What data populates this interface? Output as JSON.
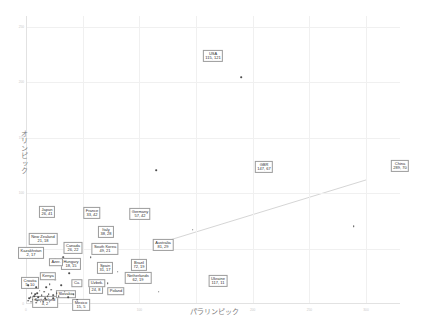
{
  "chart_data": {
    "type": "scatter",
    "title": "",
    "xlabel": "パラリンピック",
    "ylabel": "オリンピック",
    "xlim": [
      0,
      330
    ],
    "ylim": [
      0,
      260
    ],
    "grid": true,
    "legend": "none",
    "trendline": {
      "visible": true,
      "x1": 118,
      "y1": 55,
      "x2": 300,
      "y2": 112
    },
    "xticks": [
      "0",
      "50",
      "100",
      "150",
      "200",
      "250",
      "300"
    ],
    "yticks": [
      "0",
      "50",
      "100",
      "150",
      "200",
      "250"
    ],
    "points": [
      {
        "name": "USA",
        "x": 115,
        "y": 121,
        "label": "115, 121",
        "boxed": true,
        "lx": 213,
        "ly": 56
      },
      {
        "name": "China",
        "x": 289,
        "y": 70,
        "label": "289, 70",
        "boxed": true,
        "lx": 400,
        "ly": 166
      },
      {
        "name": "GBR",
        "x": 147,
        "y": 67,
        "label": "147, 67",
        "boxed": true,
        "lx": 264,
        "ly": 167
      },
      {
        "name": "Ukraine",
        "x": 117,
        "y": 11,
        "label": "117, 11",
        "boxed": true,
        "lx": 218,
        "ly": 281
      },
      {
        "name": "Australia",
        "x": 81,
        "y": 29,
        "label": "81, 29",
        "boxed": true,
        "lx": 163,
        "ly": 245
      },
      {
        "name": "Brazil",
        "x": 72,
        "y": 19,
        "label": "72, 19",
        "boxed": true,
        "lx": 139,
        "ly": 265
      },
      {
        "name": "Netherlands",
        "x": 62,
        "y": 19,
        "label": "62, 19",
        "boxed": true,
        "lx": 138,
        "ly": 278
      },
      {
        "name": "Germany",
        "x": 57,
        "y": 42,
        "label": "57, 42",
        "boxed": true,
        "lx": 140,
        "ly": 214
      },
      {
        "name": "South Korea",
        "x": 49,
        "y": 21,
        "label": "49, 21",
        "boxed": true,
        "lx": 105,
        "ly": 249
      },
      {
        "name": "Italy",
        "x": 38,
        "y": 28,
        "label": "38, 28",
        "boxed": true,
        "lx": 106,
        "ly": 232
      },
      {
        "name": "France",
        "x": 33,
        "y": 42,
        "label": "33, 42",
        "boxed": true,
        "lx": 92,
        "ly": 213
      },
      {
        "name": "Spain",
        "x": 31,
        "y": 17,
        "label": "31, 17",
        "boxed": true,
        "lx": 105,
        "ly": 268
      },
      {
        "name": "Japan",
        "x": 26,
        "y": 41,
        "label": "26, 41",
        "boxed": true,
        "lx": 47,
        "ly": 212
      },
      {
        "name": "Canada",
        "x": 26,
        "y": 22,
        "label": "26, 22",
        "boxed": true,
        "lx": 73,
        "ly": 248
      },
      {
        "name": "Iran",
        "x": 24,
        "y": 8,
        "label": "24, 8",
        "boxed": true,
        "lx": 96,
        "ly": 288
      },
      {
        "name": "New Zealand",
        "x": 21,
        "y": 18,
        "label": "21, 18",
        "boxed": true,
        "lx": 43,
        "ly": 239
      },
      {
        "name": "Hungary",
        "x": 18,
        "y": 15,
        "label": "18, 15",
        "boxed": true,
        "lx": 71,
        "ly": 264
      },
      {
        "name": "Mexico",
        "x": 15,
        "y": 5,
        "label": "15, 5",
        "boxed": true,
        "lx": 81,
        "ly": 305
      },
      {
        "name": "Croatia",
        "x": 5,
        "y": 10,
        "label": "5, 10",
        "boxed": true,
        "lx": 30,
        "ly": 283
      },
      {
        "name": "Kazakhstan",
        "x": 2,
        "y": 17,
        "label": "2, 17",
        "boxed": true,
        "lx": 31,
        "ly": 253
      },
      {
        "name": "Switzerland",
        "x": 4,
        "y": 2,
        "label": "4, 2",
        "boxed": true,
        "lx": 45,
        "ly": 302
      },
      {
        "name": "Azer.",
        "x": 19,
        "y": 7,
        "label": "",
        "boxed": true,
        "lx": 56,
        "ly": 262
      },
      {
        "name": "Kenya",
        "x": 10,
        "y": 10,
        "label": "",
        "boxed": true,
        "lx": 48,
        "ly": 276
      },
      {
        "name": "Cu.",
        "x": 9,
        "y": 15,
        "label": "",
        "boxed": true,
        "lx": 77,
        "ly": 283
      },
      {
        "name": "Uzbek.",
        "x": 17,
        "y": 5,
        "label": "",
        "boxed": true,
        "lx": 97,
        "ly": 283
      },
      {
        "name": "Slovakia",
        "x": 8,
        "y": 4,
        "label": "",
        "boxed": true,
        "lx": 66,
        "ly": 294
      },
      {
        "name": "Poland",
        "x": 45,
        "y": 4,
        "label": "",
        "boxed": true,
        "lx": 116,
        "ly": 291
      },
      {
        "name": "",
        "x": 2,
        "y": 3,
        "label": "",
        "boxed": false
      },
      {
        "name": "",
        "x": 3,
        "y": 5,
        "label": "",
        "boxed": false
      },
      {
        "name": "",
        "x": 4,
        "y": 6,
        "label": "",
        "boxed": false
      },
      {
        "name": "",
        "x": 6,
        "y": 4,
        "label": "",
        "boxed": false
      },
      {
        "name": "",
        "x": 7,
        "y": 7,
        "label": "",
        "boxed": false
      },
      {
        "name": "",
        "x": 8,
        "y": 9,
        "label": "",
        "boxed": false
      },
      {
        "name": "",
        "x": 10,
        "y": 3,
        "label": "",
        "boxed": false
      },
      {
        "name": "",
        "x": 11,
        "y": 6,
        "label": "",
        "boxed": false
      },
      {
        "name": "",
        "x": 12,
        "y": 12,
        "label": "",
        "boxed": false
      },
      {
        "name": "",
        "x": 13,
        "y": 2,
        "label": "",
        "boxed": false
      },
      {
        "name": "",
        "x": 14,
        "y": 8,
        "label": "",
        "boxed": false
      },
      {
        "name": "",
        "x": 16,
        "y": 11,
        "label": "",
        "boxed": false
      },
      {
        "name": "",
        "x": 18,
        "y": 4,
        "label": "",
        "boxed": false
      },
      {
        "name": "",
        "x": 20,
        "y": 9,
        "label": "",
        "boxed": false
      },
      {
        "name": "",
        "x": 22,
        "y": 13,
        "label": "",
        "boxed": false
      },
      {
        "name": "",
        "x": 24,
        "y": 5,
        "label": "",
        "boxed": false
      },
      {
        "name": "",
        "x": 27,
        "y": 10,
        "label": "",
        "boxed": false
      },
      {
        "name": "",
        "x": 29,
        "y": 7,
        "label": "",
        "boxed": false
      },
      {
        "name": "",
        "x": 34,
        "y": 11,
        "label": "",
        "boxed": false
      },
      {
        "name": "",
        "x": 37,
        "y": 6,
        "label": "",
        "boxed": false
      },
      {
        "name": "",
        "x": 42,
        "y": 9,
        "label": "",
        "boxed": false
      },
      {
        "name": "",
        "x": 5,
        "y": 2,
        "label": "",
        "boxed": false
      },
      {
        "name": "",
        "x": 9,
        "y": 1,
        "label": "",
        "boxed": false
      },
      {
        "name": "",
        "x": 15,
        "y": 2,
        "label": "",
        "boxed": false
      },
      {
        "name": "",
        "x": 21,
        "y": 2,
        "label": "",
        "boxed": false
      },
      {
        "name": "",
        "x": 190,
        "y": 205,
        "label": "",
        "boxed": false
      }
    ]
  }
}
